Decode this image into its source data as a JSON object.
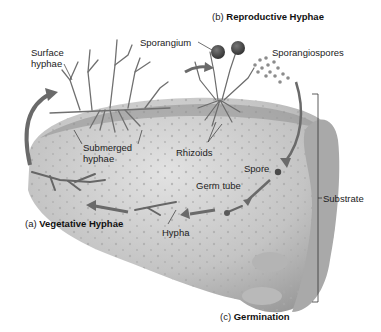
{
  "diagram": {
    "type": "life-cycle-illustration",
    "sections": {
      "a": {
        "prefix": "(a)",
        "title": "Vegetative Hyphae"
      },
      "b": {
        "prefix": "(b)",
        "title": "Reproductive Hyphae"
      },
      "c": {
        "prefix": "(c)",
        "title": "Germination"
      }
    },
    "labels": {
      "surface_hyphae_1": "Surface",
      "surface_hyphae_2": "hyphae",
      "sporangium": "Sporangium",
      "sporangiospores": "Sporangiospores",
      "submerged_hyphae_1": "Submerged",
      "submerged_hyphae_2": "hyphae",
      "rhizoids": "Rhizoids",
      "spore": "Spore",
      "germ_tube": "Germ tube",
      "hypha": "Hypha",
      "substrate": "Substrate"
    },
    "colors": {
      "substrate_fill": "#c9c9c9",
      "substrate_shadow": "#8e8e8e",
      "hyphae": "#6f6f6f",
      "arrows": "#6a6a6a",
      "sporangium": "#3a3a3a",
      "spores": "#8a8a8a",
      "text": "#222222"
    }
  }
}
